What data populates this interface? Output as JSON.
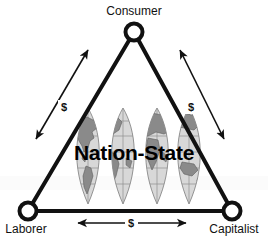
{
  "diagram": {
    "title_center": "Nation-State",
    "background_color": "#ffffff",
    "line_color": "#111111",
    "node_fill_color": "#ffffff",
    "globe_base_color": "#d4d4d4",
    "globe_land_color": "#8a8a8a",
    "nodes": [
      {
        "id": "consumer",
        "label": "Consumer",
        "x": 134,
        "y": 32,
        "label_x": 134,
        "label_y": 14,
        "anchor": "middle"
      },
      {
        "id": "laborer",
        "label": "Laborer",
        "x": 28,
        "y": 211,
        "label_x": 26,
        "label_y": 232,
        "anchor": "middle"
      },
      {
        "id": "capitalist",
        "label": "Capitalist",
        "x": 232,
        "y": 211,
        "label_x": 234,
        "label_y": 232,
        "anchor": "middle"
      }
    ],
    "edges": [
      {
        "id": "laborer-consumer",
        "from": "laborer",
        "to": "consumer"
      },
      {
        "id": "consumer-capitalist",
        "from": "consumer",
        "to": "capitalist"
      },
      {
        "id": "laborer-capitalist",
        "from": "laborer",
        "to": "capitalist"
      }
    ],
    "flows": [
      {
        "id": "flow-left",
        "label": "$",
        "label_x": 64,
        "label_y": 110,
        "direction": "bidirectional"
      },
      {
        "id": "flow-right",
        "label": "$",
        "label_x": 191,
        "label_y": 110,
        "direction": "bidirectional"
      },
      {
        "id": "flow-bottom",
        "label": "$",
        "label_x": 131,
        "label_y": 227,
        "direction": "bidirectional"
      }
    ]
  }
}
